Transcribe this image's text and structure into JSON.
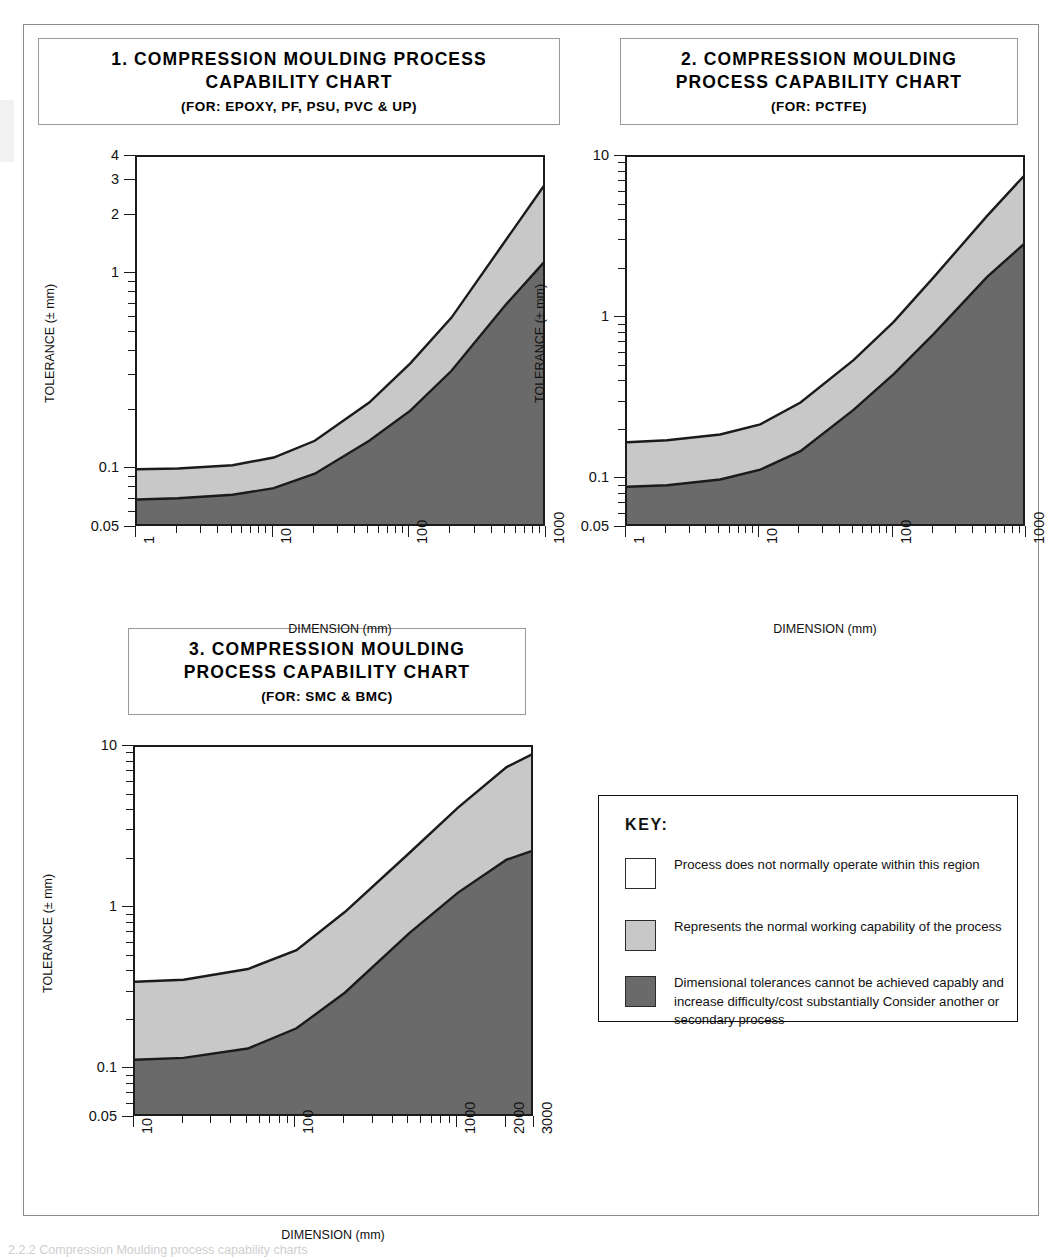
{
  "colors": {
    "band_normal": "#c8c8c8",
    "band_difficult": "#6a6a6a",
    "band_none": "#ffffff",
    "outline": "#1b1b1b"
  },
  "charts": [
    {
      "id": "chart-1",
      "title_lines": [
        "1. COMPRESSION MOULDING PROCESS",
        "CAPABILITY CHART"
      ],
      "subtitle": "(FOR: EPOXY, PF, PSU, PVC & UP)",
      "ylabel": "TOLERANCE (± mm)",
      "xlabel": "DIMENSION (mm)",
      "y_ticks": [
        "4",
        "3",
        "2",
        "1",
        "0.1",
        "0.05"
      ],
      "x_ticks": [
        "1",
        "10",
        "100",
        "1000"
      ],
      "chart_data": {
        "type": "area",
        "title": "1. COMPRESSION MOULDING PROCESS CAPABILITY CHART (FOR: EPOXY, PF, PSU, PVC & UP)",
        "xlabel": "DIMENSION (mm)",
        "ylabel": "TOLERANCE (± mm)",
        "xscale": "log",
        "yscale": "log",
        "xlim": [
          1,
          1000
        ],
        "ylim": [
          0.05,
          4
        ],
        "grid": false,
        "legend": "external key box",
        "x": [
          1,
          2,
          5,
          10,
          20,
          50,
          100,
          200,
          500,
          1000
        ],
        "series": [
          {
            "name": "upper boundary (top of normal working capability)",
            "values": [
              0.1,
              0.101,
              0.105,
              0.115,
              0.14,
              0.22,
              0.35,
              0.6,
              1.5,
              3.0
            ]
          },
          {
            "name": "lower boundary (top of difficult/costly region)",
            "values": [
              0.07,
              0.071,
              0.074,
              0.08,
              0.095,
              0.14,
              0.2,
              0.32,
              0.7,
              1.2
            ]
          }
        ]
      }
    },
    {
      "id": "chart-2",
      "title_lines": [
        "2.  COMPRESSION MOULDING",
        "PROCESS CAPABILITY CHART"
      ],
      "subtitle": "(FOR: PCTFE)",
      "ylabel": "TOLERANCE (± mm)",
      "xlabel": "DIMENSION (mm)",
      "y_ticks": [
        "10",
        "1",
        "0.1",
        "0.05"
      ],
      "x_ticks": [
        "1",
        "10",
        "100",
        "1000"
      ],
      "chart_data": {
        "type": "area",
        "title": "2. COMPRESSION MOULDING PROCESS CAPABILITY CHART (FOR: PCTFE)",
        "xlabel": "DIMENSION (mm)",
        "ylabel": "TOLERANCE (± mm)",
        "xscale": "log",
        "yscale": "log",
        "xlim": [
          1,
          1000
        ],
        "ylim": [
          0.05,
          10
        ],
        "grid": false,
        "legend": "external key box",
        "x": [
          1,
          2,
          5,
          10,
          20,
          50,
          100,
          200,
          500,
          1000
        ],
        "series": [
          {
            "name": "upper boundary (top of normal working capability)",
            "values": [
              0.17,
              0.175,
              0.19,
              0.22,
              0.3,
              0.55,
              0.95,
              1.8,
              4.3,
              8.0
            ]
          },
          {
            "name": "lower boundary (top of difficult/costly region)",
            "values": [
              0.09,
              0.092,
              0.1,
              0.115,
              0.15,
              0.27,
              0.45,
              0.8,
              1.8,
              3.0
            ]
          }
        ]
      }
    },
    {
      "id": "chart-3",
      "title_lines": [
        "3.  COMPRESSION MOULDING",
        "PROCESS CAPABILITY CHART"
      ],
      "subtitle": "(FOR: SMC & BMC)",
      "ylabel": "TOLERANCE (± mm)",
      "xlabel": "DIMENSION (mm)",
      "y_ticks": [
        "10",
        "1",
        "0.1",
        "0.05"
      ],
      "x_ticks": [
        "10",
        "100",
        "1000",
        "2000",
        "3000"
      ],
      "chart_data": {
        "type": "area",
        "title": "3. COMPRESSION MOULDING PROCESS CAPABILITY CHART (FOR: SMC & BMC)",
        "xlabel": "DIMENSION (mm)",
        "ylabel": "TOLERANCE (± mm)",
        "xscale": "log",
        "yscale": "log",
        "xlim": [
          10,
          3000
        ],
        "ylim": [
          0.05,
          10
        ],
        "grid": false,
        "legend": "external key box",
        "x": [
          10,
          20,
          50,
          100,
          200,
          500,
          1000,
          2000,
          3000
        ],
        "series": [
          {
            "name": "upper boundary (top of normal working capability)",
            "values": [
              0.35,
              0.36,
              0.42,
              0.55,
              0.95,
              2.2,
              4.2,
              7.5,
              9.2
            ]
          },
          {
            "name": "lower boundary (top of difficult/costly region)",
            "values": [
              0.115,
              0.118,
              0.135,
              0.18,
              0.3,
              0.7,
              1.25,
              2.0,
              2.3
            ]
          }
        ]
      }
    }
  ],
  "key": {
    "title": "KEY:",
    "items": [
      {
        "swatch": "none",
        "text": "Process does not normally operate within this region"
      },
      {
        "swatch": "normal",
        "text": "Represents the normal working capability of the process"
      },
      {
        "swatch": "difficult",
        "text": "Dimensional tolerances cannot be achieved capably and increase difficulty/cost substantially Consider another or secondary process"
      }
    ]
  },
  "bottom_caption": "2.2.2 Compression Moulding process capability charts"
}
